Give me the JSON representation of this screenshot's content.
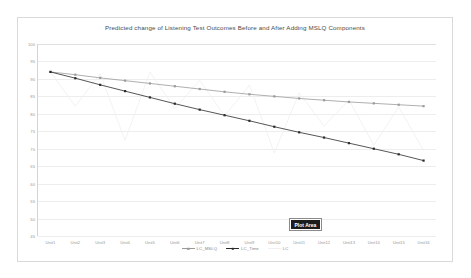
{
  "chart_data": {
    "type": "line",
    "title": "Predicted change of Listening Test Outcomes Before and After Adding MSLQ Components",
    "xlabel": "",
    "ylabel": "",
    "ylim": [
      45,
      100
    ],
    "yticks": [
      100,
      95,
      90,
      85,
      80,
      75,
      70,
      65,
      60,
      55,
      50,
      45
    ],
    "grid": true,
    "legend_position": "bottom",
    "categories": [
      "Unit1",
      "Unit2",
      "Unit3",
      "Unit4",
      "Unit5",
      "Unit6",
      "Unit7",
      "Unit8",
      "Unit9",
      "Unit10",
      "Unit11",
      "Unit12",
      "Unit13",
      "Unit14",
      "Unit15",
      "Unit16"
    ],
    "series": [
      {
        "name": "LC_MSLQ",
        "color": "#9a9a9a",
        "marker": "square",
        "values": [
          92.0,
          91.2,
          90.3,
          89.5,
          88.7,
          87.9,
          87.1,
          86.3,
          85.6,
          85.0,
          84.4,
          83.9,
          83.4,
          83.0,
          82.6,
          82.2
        ]
      },
      {
        "name": "LC_Time",
        "color": "#2b2b2b",
        "marker": "square",
        "values": [
          92.0,
          90.2,
          88.3,
          86.5,
          84.7,
          82.9,
          81.2,
          79.6,
          78.0,
          76.3,
          74.7,
          73.2,
          71.6,
          70.0,
          68.4,
          66.6
        ]
      },
      {
        "name": "LC",
        "color": "#f0f0f0",
        "marker": "none",
        "values": [
          92.0,
          82.2,
          91.5,
          72.4,
          92.0,
          81.5,
          89.6,
          79.4,
          88.2,
          68.8,
          86.0,
          76.5,
          84.0,
          71.0,
          82.0,
          69.5
        ]
      }
    ],
    "annotations": [
      {
        "name": "plot-area-tooltip",
        "text": "Plot Area"
      }
    ]
  }
}
